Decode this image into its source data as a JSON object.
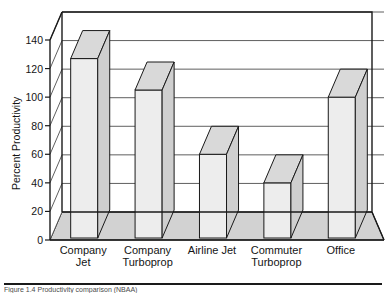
{
  "figure": {
    "caption": "Figure 1.4   Productivity comparison (NBAA)",
    "caption_rule": true
  },
  "chart_data": {
    "type": "bar",
    "title": "",
    "subtitle": "",
    "xlabel": "",
    "ylabel": "Percent Productivity",
    "categories": [
      "Company Jet",
      "Company Turboprop",
      "Airline Jet",
      "Commuter Turboprop",
      "Office"
    ],
    "category_lines": [
      [
        "Company",
        "Jet"
      ],
      [
        "Company",
        "Turboprop"
      ],
      [
        "Airline Jet",
        ""
      ],
      [
        "Commuter",
        "Turboprop"
      ],
      [
        "Office",
        ""
      ]
    ],
    "values": [
      127,
      105,
      60,
      40,
      100
    ],
    "ylim": [
      0,
      140
    ],
    "ytick_labels": [
      "0",
      "20",
      "40",
      "60",
      "80",
      "100",
      "120",
      "140"
    ],
    "yticks": [
      0,
      20,
      40,
      60,
      80,
      100,
      120,
      140
    ],
    "grid": true,
    "grid_axis": "y",
    "legend": null,
    "style": "3d-bar",
    "colors": {
      "bar_front": "#ededed",
      "bar_top": "#d9d9d9",
      "bar_side": "#cfcfcf",
      "floor": "#d2d2d2",
      "wall": "#ffffff",
      "line": "#1a1a1a",
      "grid_line": "#4d4d4d",
      "text": "#141414"
    }
  }
}
